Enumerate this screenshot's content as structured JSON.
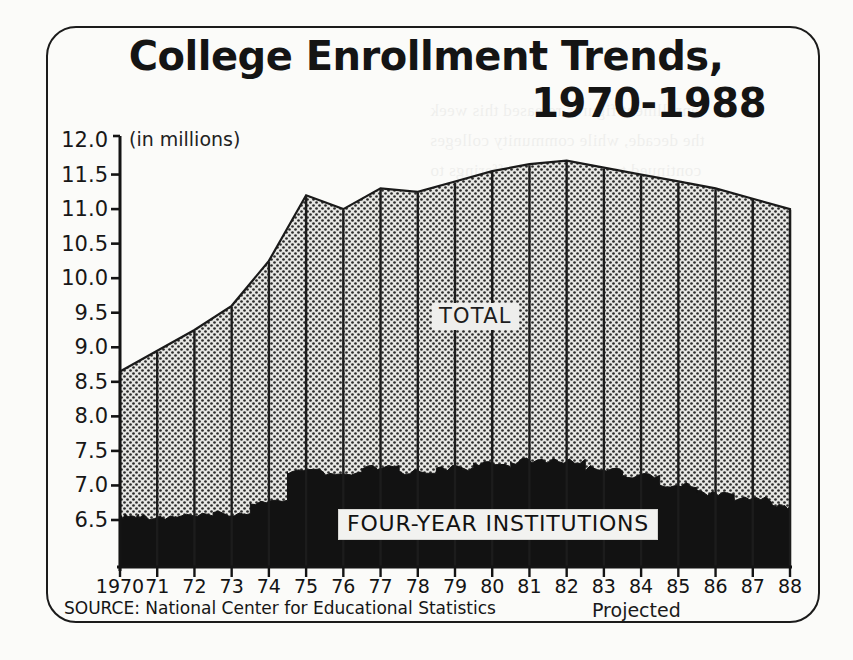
{
  "figure": {
    "title_line1": "College Enrollment Trends,",
    "title_line2": "1970-1988",
    "units_label": "(in millions)",
    "source_note": "SOURCE: National Center for Educational Statistics",
    "projected_note": "Projected",
    "label_total": "TOTAL",
    "label_fouryear": "FOUR-YEAR INSTITUTIONS",
    "colors": {
      "ink": "#141414",
      "frame": "#1b1b1b",
      "paper": "#fbfbf9",
      "total_fill": "#d8d8d5",
      "fouryear_fill": "#121212",
      "label_box": "#eeeeec"
    }
  },
  "chart_data": {
    "type": "area",
    "subtitle": "(in millions)",
    "xlabel": "",
    "ylabel": "",
    "ylim": [
      6.2,
      12.0
    ],
    "xlim": [
      1970,
      1988
    ],
    "grid": false,
    "legend": "in-plot labels",
    "stacked": false,
    "note": "Projected values begin after 1984; vertical rules drawn at each year.",
    "source": "National Center for Educational Statistics",
    "x": [
      1970,
      1971,
      1972,
      1973,
      1974,
      1975,
      1976,
      1977,
      1978,
      1979,
      1980,
      1981,
      1982,
      1983,
      1984,
      1985,
      1986,
      1987,
      1988
    ],
    "ytick_labels": [
      "12.0",
      "11.5",
      "11.0",
      "10.5",
      "10.0",
      "9.5",
      "9.0",
      "8.5",
      "8.0",
      "7.5",
      "7.0",
      "6.5"
    ],
    "ytick_values": [
      12.0,
      11.5,
      11.0,
      10.5,
      10.0,
      9.5,
      9.0,
      8.5,
      8.0,
      7.5,
      7.0,
      6.5
    ],
    "xtick_labels": [
      "1970",
      "71",
      "72",
      "73",
      "74",
      "75",
      "76",
      "77",
      "78",
      "79",
      "80",
      "81",
      "82",
      "83",
      "84",
      "85",
      "86",
      "87",
      "88"
    ],
    "series": [
      {
        "name": "TOTAL",
        "fill": "dotted-light",
        "values": [
          8.65,
          8.95,
          9.25,
          9.6,
          10.25,
          11.2,
          11.0,
          11.3,
          11.25,
          11.4,
          11.55,
          11.65,
          11.7,
          11.6,
          11.5,
          11.4,
          11.3,
          11.15,
          11.0
        ]
      },
      {
        "name": "FOUR-YEAR INSTITUTIONS",
        "fill": "solid-black",
        "values": [
          6.55,
          6.55,
          6.55,
          6.6,
          6.75,
          7.2,
          7.15,
          7.25,
          7.2,
          7.25,
          7.3,
          7.35,
          7.35,
          7.25,
          7.15,
          7.0,
          6.9,
          6.8,
          6.7
        ]
      }
    ]
  },
  "ghost_text": [
    "enrollment figures released this week",
    "the decade, while community colleges",
    "continued to expand their offerings to",
    "a broader population. Officials at the",
    "Department noted that the projected",
    "decline reflects smaller cohorts of",
    "graduating seniors.",
    "",
    "Four-year institutions absorbed the",
    "larger share of the increase through",
    "the late seventies, though the margin",
    "narrowed after 1982 as tuition rose",
    "faster than median family income in",
    "most regions of the country."
  ]
}
